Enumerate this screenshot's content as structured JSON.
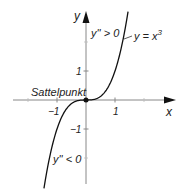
{
  "chart_data": {
    "type": "line",
    "title": "",
    "xlabel": "x",
    "ylabel": "y",
    "xlim": [
      -1.5,
      1.5
    ],
    "ylim": [
      -2.9,
      3.0
    ],
    "x_ticks": [
      -1,
      1
    ],
    "y_ticks": [
      1,
      -1
    ],
    "x_tick_labels": [
      "−1",
      "1"
    ],
    "y_tick_labels": [
      "1",
      "−1"
    ],
    "grid": false,
    "series": [
      {
        "name": "y = x³",
        "function": "x^3",
        "x": [
          -1.45,
          -1.2,
          -1.0,
          -0.8,
          -0.5,
          -0.25,
          0,
          0.25,
          0.5,
          0.8,
          1.0,
          1.2,
          1.45
        ],
        "values": [
          -3.05,
          -1.728,
          -1.0,
          -0.512,
          -0.125,
          -0.016,
          0,
          0.016,
          0.125,
          0.512,
          1.0,
          1.728,
          3.05
        ]
      }
    ],
    "annotations": {
      "curve_label": "y = x",
      "curve_label_exp": "3",
      "upper_region": "y'' > 0",
      "lower_region": "y'' < 0",
      "point_label": "Sattelpunkt",
      "point": [
        0,
        0
      ]
    }
  }
}
